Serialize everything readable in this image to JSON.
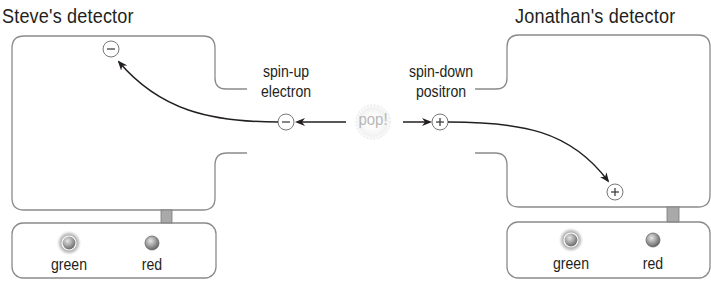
{
  "detectors": {
    "left": {
      "title": "Steve's detector",
      "lights": [
        {
          "label": "green",
          "state": "lit"
        },
        {
          "label": "red",
          "state": "off"
        }
      ],
      "particle_symbol": "−"
    },
    "right": {
      "title": "Jonathan's detector",
      "lights": [
        {
          "label": "green",
          "state": "lit"
        },
        {
          "label": "red",
          "state": "off"
        }
      ],
      "particle_symbol": "+"
    }
  },
  "center": {
    "event_label": "pop!",
    "electron": {
      "line1": "spin-up",
      "line2": "electron",
      "symbol": "−"
    },
    "positron": {
      "line1": "spin-down",
      "line2": "positron",
      "symbol": "+"
    }
  },
  "colors": {
    "outline": "#8a8a8a",
    "arrow": "#231f20",
    "text": "#231f20",
    "pop_text": "#b8b8b8",
    "connector": "#a9a9a9"
  }
}
